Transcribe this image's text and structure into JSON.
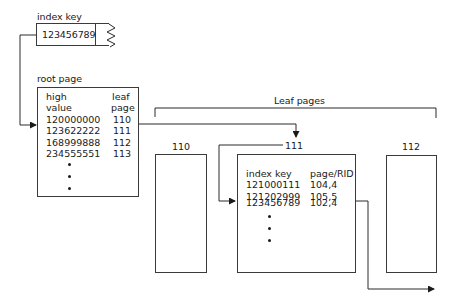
{
  "search_key": {
    "label": "index key",
    "value": "123456789"
  },
  "root_page": {
    "title": "root page",
    "columns": [
      "high\nvalue",
      "leaf\npage"
    ],
    "header_line1": [
      "high",
      "leaf"
    ],
    "header_line2": [
      "value",
      "page"
    ],
    "rows": [
      {
        "high_value": "120000000",
        "leaf_page": "110"
      },
      {
        "high_value": "123622222",
        "leaf_page": "111"
      },
      {
        "high_value": "168999888",
        "leaf_page": "112"
      },
      {
        "high_value": "234555551",
        "leaf_page": "113"
      }
    ],
    "continuation": "..."
  },
  "leaf_pages": {
    "label": "Leaf pages",
    "pages": [
      {
        "id": "110"
      },
      {
        "id": "111",
        "columns": [
          "index key",
          "page/RID"
        ],
        "rows": [
          {
            "index_key": "121000111",
            "page_rid": "104,4"
          },
          {
            "index_key": "121202999",
            "page_rid": "105,5"
          },
          {
            "index_key": "123456789",
            "page_rid": "102,4"
          }
        ],
        "continuation": "..."
      },
      {
        "id": "112"
      }
    ]
  },
  "colors": {
    "line": "#2a2a2a",
    "text": "#1a1a1a",
    "background": "#ffffff"
  }
}
